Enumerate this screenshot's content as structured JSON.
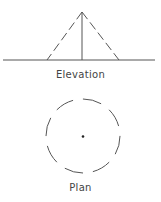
{
  "diagram": {
    "elevation": {
      "label": "Elevation",
      "apex": [
        82,
        12
      ],
      "base_left": [
        47,
        60
      ],
      "base_right": [
        119,
        60
      ],
      "ground_line": {
        "x1": 3,
        "x2": 155,
        "y": 60
      },
      "edge_style": "dashed",
      "axis_style": "solid"
    },
    "plan": {
      "label": "Plan",
      "center": [
        83,
        136
      ],
      "radius": 37,
      "circle_style": "dashed",
      "center_point": true
    },
    "stroke_color": "#555555"
  }
}
